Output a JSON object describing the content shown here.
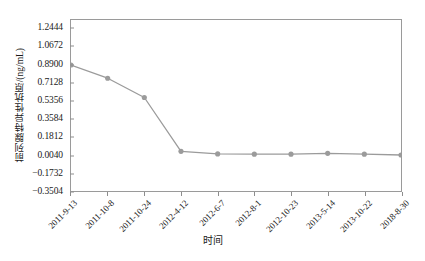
{
  "chart_data": {
    "type": "line",
    "title": "",
    "xlabel": "时间",
    "ylabel": "前列腺特异性抗原/(ng/mL)",
    "categories": [
      "2011-9-13",
      "2011-10-8",
      "2011-10-24",
      "2012-4-12",
      "2012-6-7",
      "2012-8-1",
      "2012-10-23",
      "2013-5-14",
      "2013-10-22",
      "2018-8-30"
    ],
    "values": [
      0.89,
      0.76,
      0.57,
      0.04,
      0.015,
      0.012,
      0.012,
      0.02,
      0.012,
      0.004
    ],
    "series": [
      {
        "name": "前列腺特异性抗原",
        "values": [
          0.89,
          0.76,
          0.57,
          0.04,
          0.015,
          0.012,
          0.012,
          0.02,
          0.012,
          0.004
        ]
      }
    ],
    "ylim": [
      -0.3504,
      1.333
    ],
    "yticks": [
      1.2444,
      1.0672,
      0.89,
      0.7128,
      0.5356,
      0.3584,
      0.1812,
      0.004,
      -0.1732,
      -0.3504
    ],
    "ytick_labels": [
      "1.2444",
      "1.0672",
      "0.8900",
      "0.7128",
      "0.5356",
      "0.3584",
      "0.1812",
      "0.0040",
      "−0.1732",
      "−0.3504"
    ],
    "grid": false,
    "legend": null,
    "legend_position": "none",
    "line_color": "#9b9b9b",
    "marker_color": "#9b9b9b",
    "marker_shape": "circle",
    "frame_color": "#9a9a9a"
  },
  "figure": {
    "caption": ""
  }
}
